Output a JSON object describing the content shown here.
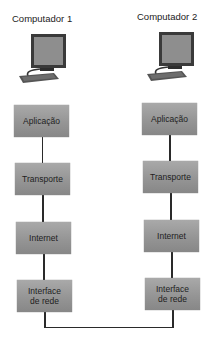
{
  "diagram": {
    "computers": [
      {
        "label": "Computador 1",
        "layers": [
          "Aplicação",
          "Transporte",
          "Internet",
          "Interface de rede"
        ]
      },
      {
        "label": "Computador 2",
        "layers": [
          "Aplicação",
          "Transporte",
          "Internet",
          "Interface de rede"
        ]
      }
    ],
    "layer_split": {
      "interface_line1": "Interface",
      "interface_line2": "de rede"
    },
    "colors": {
      "box_fill": "#969696",
      "line": "#2a2a2a",
      "monitor_frame": "#3a3a3a",
      "screen": "#8e8e8e"
    },
    "connection": "Interface de rede (Computador 1) — Interface de rede (Computador 2)"
  }
}
